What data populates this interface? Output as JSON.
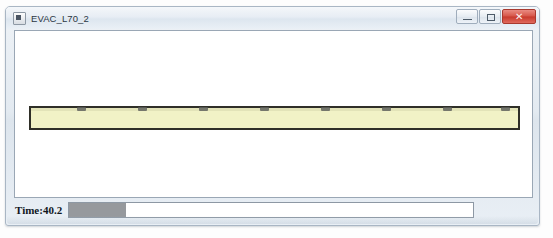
{
  "window": {
    "title": "EVAC_L70_2",
    "icon": "application-icon",
    "controls": {
      "minimize_label": "–",
      "maximize_label": "□",
      "close_label": "✕"
    }
  },
  "canvas": {
    "background_color": "#ffffff",
    "corridor": {
      "fill_color": "#f1f2c6",
      "border_color": "#2f2f28",
      "left": 14,
      "top": 75,
      "width": 491,
      "height": 24,
      "agent_positions": [
        46,
        107,
        168,
        229,
        290,
        351,
        412,
        470
      ],
      "agent_color": "#5d5f5c",
      "agent_count": 8
    }
  },
  "status": {
    "time_label": "Time:40.2",
    "progress_percent": 14,
    "progress_fill_color": "#96999d",
    "track_color": "#ffffff"
  }
}
